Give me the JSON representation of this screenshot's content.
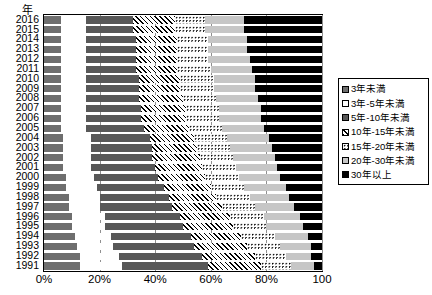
{
  "axis_title": "年",
  "legend": {
    "items": [
      {
        "label": "3年未満",
        "pattern": "solid-dark-gray"
      },
      {
        "label": "3年-5年未満",
        "pattern": "white"
      },
      {
        "label": "5年-10年未満",
        "pattern": "medium-gray"
      },
      {
        "label": "10年-15年未満",
        "pattern": "diagonal-hatch"
      },
      {
        "label": "15年-20年未満",
        "pattern": "dotted"
      },
      {
        "label": "20年-30年未満",
        "pattern": "light-gray"
      },
      {
        "label": "30年以上",
        "pattern": "solid-black"
      }
    ]
  },
  "chart_data": {
    "type": "bar",
    "orientation": "horizontal",
    "stacked": "100-percent",
    "title": "",
    "xlabel": "",
    "ylabel": "年",
    "xlim": [
      0,
      100
    ],
    "xticks": [
      "0%",
      "20%",
      "40%",
      "60%",
      "80%",
      "100"
    ],
    "xtick_values": [
      0,
      20,
      40,
      60,
      80,
      100
    ],
    "grid": true,
    "legend_position": "right",
    "categories": [
      "2016",
      "2015",
      "2014",
      "2013",
      "2012",
      "2011",
      "2010",
      "2009",
      "2008",
      "2007",
      "2006",
      "2005",
      "2004",
      "2003",
      "2002",
      "2001",
      "2000",
      "1999",
      "1998",
      "1997",
      "1996",
      "1995",
      "1994",
      "1993",
      "1992",
      "1991"
    ],
    "series": [
      {
        "name": "3年未満",
        "values": [
          6,
          6,
          6,
          6,
          6,
          6,
          6,
          6,
          6,
          6,
          6,
          6,
          7,
          7,
          7,
          7,
          8,
          8,
          9,
          9,
          10,
          10,
          11,
          12,
          13,
          13
        ]
      },
      {
        "name": "3年-5年未満",
        "values": [
          9,
          9,
          9,
          9,
          9,
          9,
          9,
          9,
          9,
          9,
          9,
          9,
          10,
          10,
          10,
          10,
          10,
          11,
          11,
          11,
          12,
          12,
          13,
          13,
          14,
          15
        ]
      },
      {
        "name": "5年-10年未満",
        "values": [
          17,
          17,
          18,
          18,
          18,
          18,
          19,
          19,
          19,
          20,
          20,
          21,
          21,
          22,
          22,
          23,
          23,
          24,
          25,
          26,
          27,
          28,
          29,
          29,
          30,
          31
        ]
      },
      {
        "name": "10年-15年未満",
        "values": [
          15,
          15,
          15,
          15,
          15,
          15,
          15,
          15,
          16,
          16,
          16,
          16,
          16,
          16,
          17,
          17,
          17,
          17,
          17,
          18,
          18,
          18,
          18,
          19,
          19,
          19
        ]
      },
      {
        "name": "15年-20年未満",
        "values": [
          11,
          11,
          11,
          11,
          11,
          12,
          12,
          12,
          12,
          12,
          12,
          12,
          12,
          12,
          12,
          12,
          12,
          12,
          12,
          12,
          12,
          12,
          12,
          12,
          11,
          11
        ]
      },
      {
        "name": "20年-30年未満",
        "values": [
          14,
          14,
          14,
          14,
          15,
          15,
          15,
          15,
          15,
          15,
          15,
          15,
          15,
          15,
          15,
          15,
          15,
          15,
          14,
          14,
          13,
          13,
          12,
          11,
          9,
          8
        ]
      },
      {
        "name": "30年以上",
        "values": [
          28,
          28,
          27,
          27,
          26,
          25,
          24,
          24,
          23,
          22,
          22,
          21,
          19,
          18,
          17,
          16,
          15,
          13,
          12,
          10,
          8,
          7,
          5,
          4,
          4,
          3
        ]
      }
    ]
  }
}
